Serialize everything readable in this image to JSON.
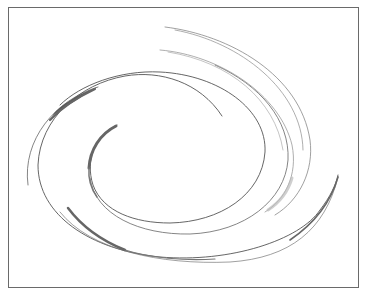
{
  "image": {
    "description": "Decorative swirl / vortex line art inside a thin rectangular frame",
    "frame": {
      "x": 8,
      "y": 7,
      "width": 351,
      "height": 281,
      "border_color": "#6a6a6a"
    },
    "background": "#ffffff",
    "colors": {
      "line_dark": "#555555",
      "line_mid": "#777777",
      "line_light": "#aaaaaa",
      "stroke_heavy": "#666666"
    },
    "elements": [
      "outer-swirl-arc",
      "inner-spiral-arc",
      "upper-right-arcs",
      "heavy-brush-strokes"
    ]
  }
}
